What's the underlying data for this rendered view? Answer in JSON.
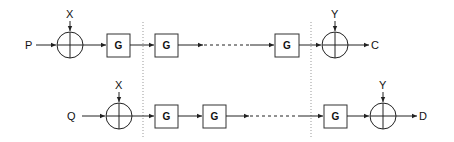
{
  "diagram": {
    "rows": [
      {
        "input": "P",
        "top_input_1": "X",
        "blocks": [
          "G",
          "G",
          "G"
        ],
        "top_input_2": "Y",
        "output": "C"
      },
      {
        "input": "Q",
        "top_input_1": "X",
        "blocks": [
          "G",
          "G",
          "G"
        ],
        "top_input_2": "Y",
        "output": "D"
      }
    ],
    "colors": {
      "line": "#222222",
      "separator": "#999999",
      "background": "#ffffff"
    }
  }
}
